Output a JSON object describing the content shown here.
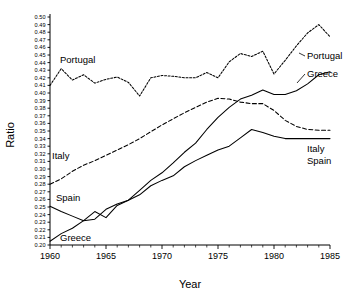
{
  "chart_data": {
    "type": "line",
    "title": "",
    "xlabel": "Year",
    "ylabel": "Ratio",
    "xlim": [
      1960,
      1985
    ],
    "ylim": [
      0.2,
      0.5
    ],
    "grid": false,
    "legend_position": "inline-labels",
    "x": [
      1960,
      1961,
      1962,
      1963,
      1964,
      1965,
      1966,
      1967,
      1968,
      1969,
      1970,
      1971,
      1972,
      1973,
      1974,
      1975,
      1976,
      1977,
      1978,
      1979,
      1980,
      1981,
      1982,
      1983,
      1984,
      1985
    ],
    "xticks_major": [
      1960,
      1965,
      1970,
      1975,
      1980,
      1985
    ],
    "xtick_labels": [
      "1960",
      "1965",
      "1970",
      "1975",
      "1980",
      "1985"
    ],
    "yticks": [
      0.2,
      0.21,
      0.22,
      0.23,
      0.24,
      0.25,
      0.26,
      0.27,
      0.28,
      0.29,
      0.3,
      0.31,
      0.32,
      0.33,
      0.34,
      0.35,
      0.36,
      0.37,
      0.38,
      0.39,
      0.4,
      0.41,
      0.42,
      0.43,
      0.44,
      0.45,
      0.46,
      0.47,
      0.48,
      0.49,
      0.5
    ],
    "ytick_labels": [
      "0.20",
      "0.21",
      "0.22",
      "0.23",
      "0.24",
      "0.25",
      "0.26",
      "0.27",
      "0.28",
      "0.29",
      "0.30",
      "0.31",
      "0.32",
      "0.33",
      "0.34",
      "0.35",
      "0.36",
      "0.37",
      "0.38",
      "0.39",
      "0.40",
      "0.41",
      "0.42",
      "0.43",
      "0.44",
      "0.45",
      "0.46",
      "0.47",
      "0.48",
      "0.49",
      "0.50"
    ],
    "series": [
      {
        "name": "Portugal",
        "style": "dotted",
        "dasharray": "2,1.6",
        "label_left": "Portugal",
        "label_right": "Portugal",
        "values": [
          0.41,
          0.432,
          0.417,
          0.424,
          0.413,
          0.418,
          0.421,
          0.414,
          0.396,
          0.42,
          0.423,
          0.422,
          0.42,
          0.42,
          0.427,
          0.42,
          0.441,
          0.452,
          0.448,
          0.455,
          0.425,
          0.443,
          0.462,
          0.479,
          0.49,
          0.474
        ]
      },
      {
        "name": "Greece",
        "style": "solid",
        "dasharray": "none",
        "label_left": "Greece",
        "label_right": "Greece",
        "values": [
          0.205,
          0.215,
          0.222,
          0.232,
          0.234,
          0.247,
          0.254,
          0.259,
          0.272,
          0.285,
          0.295,
          0.308,
          0.322,
          0.334,
          0.352,
          0.368,
          0.381,
          0.392,
          0.397,
          0.404,
          0.398,
          0.398,
          0.403,
          0.412,
          0.424,
          0.428
        ]
      },
      {
        "name": "Italy",
        "style": "dashed",
        "dasharray": "4,2.4",
        "label_left": "Italy",
        "label_right": "Italy",
        "values": [
          0.28,
          0.287,
          0.297,
          0.305,
          0.311,
          0.318,
          0.325,
          0.332,
          0.34,
          0.349,
          0.358,
          0.366,
          0.374,
          0.381,
          0.388,
          0.393,
          0.392,
          0.388,
          0.386,
          0.386,
          0.377,
          0.364,
          0.356,
          0.352,
          0.351,
          0.351
        ]
      },
      {
        "name": "Spain",
        "style": "solid",
        "dasharray": "none",
        "label_left": "Spain",
        "label_right": "Spain",
        "values": [
          0.251,
          0.244,
          0.238,
          0.232,
          0.244,
          0.236,
          0.252,
          0.259,
          0.266,
          0.278,
          0.285,
          0.291,
          0.303,
          0.311,
          0.318,
          0.325,
          0.33,
          0.341,
          0.352,
          0.348,
          0.343,
          0.34,
          0.34,
          0.34,
          0.34,
          0.34
        ]
      }
    ]
  }
}
